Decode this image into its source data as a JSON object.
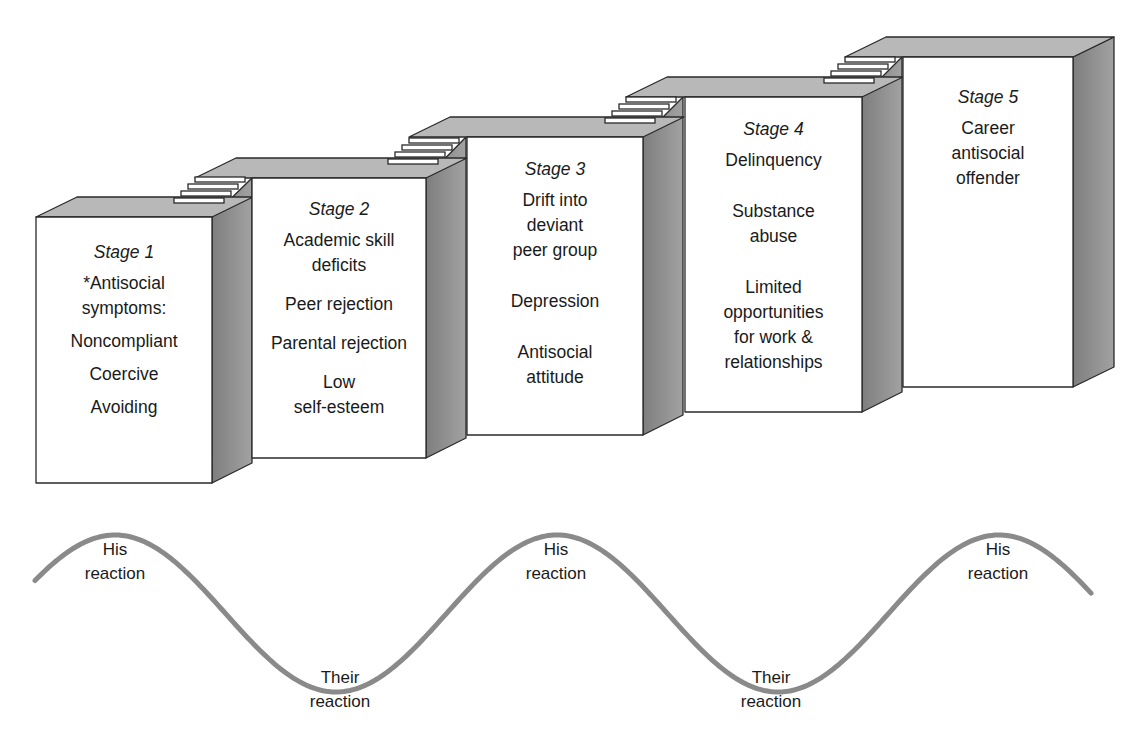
{
  "stages": [
    {
      "title": "Stage 1",
      "items": [
        "*Antisocial\nsymptoms:",
        "Noncompliant",
        "Coercive",
        "Avoiding"
      ]
    },
    {
      "title": "Stage 2",
      "items": [
        "Academic skill\ndeficits",
        "Peer rejection",
        "Parental rejection",
        "Low\nself-esteem"
      ]
    },
    {
      "title": "Stage 3",
      "items": [
        "Drift into\ndeviant\npeer group",
        "Depression",
        "Antisocial\nattitude"
      ]
    },
    {
      "title": "Stage 4",
      "items": [
        "Delinquency",
        "Substance\nabuse",
        "Limited\nopportunities\nfor work &\nrelationships"
      ]
    },
    {
      "title": "Stage 5",
      "items": [
        "Career\nantisocial\noffender"
      ]
    }
  ],
  "wave": {
    "labels": [
      {
        "text": "His\nreaction",
        "position": "peak"
      },
      {
        "text": "Their\nreaction",
        "position": "trough"
      },
      {
        "text": "His\nreaction",
        "position": "peak"
      },
      {
        "text": "Their\nreaction",
        "position": "trough"
      },
      {
        "text": "His\nreaction",
        "position": "peak"
      }
    ]
  },
  "colors": {
    "front": "#ffffff",
    "top": "#b8b8b8",
    "side": "#8e8e8e",
    "outline": "#2a2a2a",
    "wave": "#8a8a8a"
  }
}
